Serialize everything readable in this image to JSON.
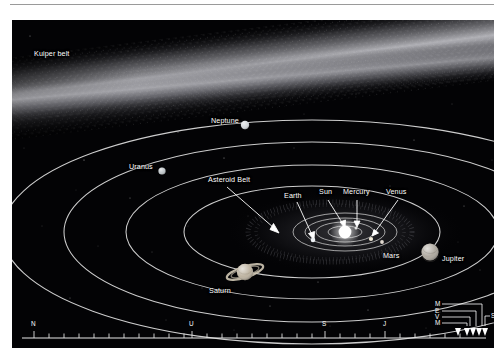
{
  "figure": {
    "kind": "solar-system-diagram",
    "background_color": "#030305",
    "line_color": "#d8d8d8",
    "text_color": "#ffffff",
    "page_background": "#ffffff"
  },
  "labels": {
    "kuiper_belt": "Kuiper belt",
    "neptune": "Neptune",
    "uranus": "Uranus",
    "asteroid_belt": "Asteroid Belt",
    "earth": "Earth",
    "sun": "Sun",
    "mercury": "Mercury",
    "venus": "Venus",
    "mars": "Mars",
    "jupiter": "Jupiter",
    "saturn": "Saturn"
  },
  "bodies": [
    {
      "name": "Neptune",
      "x": 233,
      "y": 105,
      "r": 4.2,
      "color": "#cfd4d8",
      "rings": false
    },
    {
      "name": "Uranus",
      "x": 150,
      "y": 151,
      "r": 3.6,
      "color": "#b9c0c4",
      "rings": false
    },
    {
      "name": "Saturn",
      "x": 233,
      "y": 252,
      "r": 8.2,
      "color": "#b9ae9a",
      "rings": true
    },
    {
      "name": "Jupiter",
      "x": 418,
      "y": 232,
      "r": 8.6,
      "color": "#a8a298",
      "rings": false
    },
    {
      "name": "Sun",
      "x": 333,
      "y": 212,
      "r": 6.4,
      "color": "#ffffff",
      "rings": false
    },
    {
      "name": "Mars",
      "x": 370,
      "y": 222,
      "r": 1.9,
      "color": "#c9c1b6",
      "rings": false
    },
    {
      "name": "Earth",
      "x": 301,
      "y": 220,
      "r": 2.3,
      "color": "#dfe4e8",
      "rings": false
    },
    {
      "name": "Venus",
      "x": 359,
      "y": 219,
      "r": 2.1,
      "color": "#e4dcc9",
      "rings": false
    },
    {
      "name": "Mercury",
      "x": 344,
      "y": 208,
      "r": 1.5,
      "color": "#cfcfcf",
      "rings": false
    }
  ],
  "orbits": [
    {
      "name": "Neptune",
      "cx": 300,
      "cy": 212,
      "rx": 310,
      "ry": 112
    },
    {
      "name": "Uranus",
      "cx": 300,
      "cy": 212,
      "rx": 248,
      "ry": 90
    },
    {
      "name": "Saturn",
      "cx": 300,
      "cy": 212,
      "rx": 186,
      "ry": 67
    },
    {
      "name": "Jupiter",
      "cx": 300,
      "cy": 212,
      "rx": 128,
      "ry": 46
    },
    {
      "name": "Mars",
      "cx": 333,
      "cy": 212,
      "rx": 52,
      "ry": 19
    },
    {
      "name": "Earth",
      "cx": 333,
      "cy": 212,
      "rx": 40,
      "ry": 14
    },
    {
      "name": "Venus",
      "cx": 333,
      "cy": 212,
      "rx": 29,
      "ry": 10
    },
    {
      "name": "Mercury",
      "cx": 333,
      "cy": 212,
      "rx": 17,
      "ry": 6
    }
  ],
  "leaders": [
    {
      "name": "Asteroid Belt",
      "x1": 215,
      "y1": 167,
      "x2": 263,
      "y2": 210
    },
    {
      "name": "Earth",
      "x1": 285,
      "y1": 180,
      "x2": 303,
      "y2": 214
    },
    {
      "name": "Sun",
      "x1": 315,
      "y1": 176,
      "x2": 333,
      "y2": 205
    },
    {
      "name": "Mercury",
      "x1": 344,
      "y1": 176,
      "x2": 345,
      "y2": 204
    },
    {
      "name": "Venus",
      "x1": 385,
      "y1": 176,
      "x2": 361,
      "y2": 214
    }
  ],
  "scale_bar": {
    "major_ticks": [
      {
        "label": "N",
        "x": 22
      },
      {
        "label": "U",
        "x": 180
      },
      {
        "label": "S",
        "x": 325
      },
      {
        "label": "J",
        "x": 390
      }
    ],
    "inner_cluster": [
      {
        "label": "M",
        "body": "Mars"
      },
      {
        "label": "E",
        "body": "Earth"
      },
      {
        "label": "V",
        "body": "Venus"
      },
      {
        "label": "M",
        "body": "Mercury"
      },
      {
        "label": "SUN",
        "body": "Sun"
      }
    ],
    "minor_tick_count": 30
  }
}
